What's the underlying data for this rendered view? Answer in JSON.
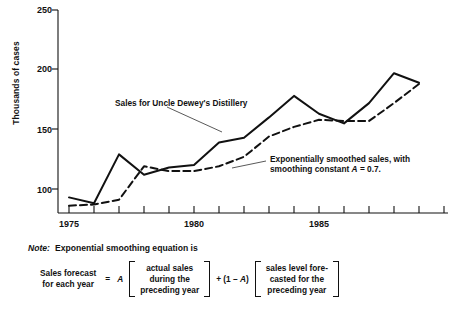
{
  "chart_data": {
    "type": "line",
    "title": "",
    "xlabel": "",
    "ylabel": "Thousands of cases",
    "ylim": [
      75,
      250
    ],
    "yticks": [
      100,
      150,
      200,
      250
    ],
    "ytick_labels": [
      "100",
      "150",
      "200",
      "250"
    ],
    "xlim": [
      1974,
      1989
    ],
    "xticks": [
      1974,
      1975,
      1976,
      1977,
      1978,
      1979,
      1980,
      1981,
      1982,
      1983,
      1984,
      1985,
      1986,
      1987,
      1988,
      1989
    ],
    "xtick_labels_shown": [
      "1975",
      "1980",
      "1985"
    ],
    "xtick_label_years": [
      1975,
      1980,
      1985
    ],
    "grid": false,
    "legend": "none (inline annotations with leader lines)",
    "x": [
      1974,
      1975,
      1976,
      1977,
      1978,
      1979,
      1980,
      1981,
      1982,
      1983,
      1984,
      1985,
      1986,
      1987,
      1988
    ],
    "series": [
      {
        "name": "Sales for Uncle Dewey's Distillery",
        "style": "solid",
        "color": "#111111",
        "values": [
          93,
          88,
          129,
          112,
          118,
          120,
          139,
          143,
          160,
          178,
          163,
          155,
          172,
          197,
          189
        ]
      },
      {
        "name": "Exponentially smoothed sales, with smoothing constant A = 0.7.",
        "style": "dashed",
        "color": "#111111",
        "values": [
          86,
          87,
          91,
          119,
          115,
          115,
          119,
          127,
          144,
          152,
          158,
          157,
          157,
          172,
          188
        ]
      }
    ],
    "annotations": [
      {
        "name": "sales-annotation",
        "text": "Sales for Uncle Dewey's Distillery",
        "target_series": "Sales for Uncle Dewey's Distillery"
      },
      {
        "name": "smoothed-annotation",
        "line1": "Exponentially smoothed sales, with",
        "line2_pre": "smoothing constant ",
        "line2_var": "A",
        "line2_post": " = 0.7.",
        "target_series": "Exponentially smoothed sales"
      }
    ]
  },
  "note": {
    "label": "Note:",
    "text": "Exponential smoothing equation is"
  },
  "equation": {
    "lhs_line1": "Sales forecast",
    "lhs_line2": "for each year",
    "equals": "=",
    "coefficient": "A",
    "bracket1_line1": "actual sales",
    "bracket1_line2": "during the",
    "bracket1_line3": "preceding year",
    "plus_pre": "+ (1 – ",
    "plus_var": "A",
    "plus_post": ")",
    "bracket2_line1": "sales level fore-",
    "bracket2_line2": "casted for the",
    "bracket2_line3": "preceding year"
  }
}
